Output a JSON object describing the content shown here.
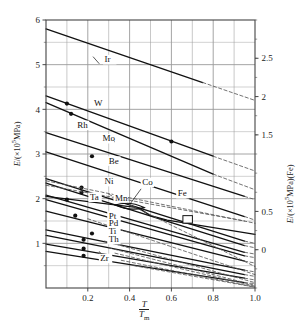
{
  "figure": {
    "xlabel_numerator": "T",
    "xlabel_denominator": "T",
    "xlabel_denominator_sub": "m",
    "ylabel_left": "E/(×10⁵MPa)",
    "ylabel_right": "E/(×10⁵MPa)(Fe)",
    "background": "#ffffff",
    "line_color": "#111111",
    "grid_color": "#9a9a9a"
  },
  "chart_data": {
    "type": "line",
    "title": "",
    "xlabel": "T/Tm",
    "ylabel": "E/(×10⁵MPa)",
    "ylabel_right": "E/(×10⁵MPa)(Fe)",
    "xlim": [
      0.0,
      1.0
    ],
    "ylim": [
      0.0,
      6.0
    ],
    "ylim_right": [
      -0.5,
      3.0
    ],
    "xticks": [
      0.2,
      0.4,
      0.6,
      0.8,
      1.0
    ],
    "xticklabels": [
      "0.2",
      "0.4",
      "0.6",
      "0.8",
      "1.0"
    ],
    "yticks": [
      1,
      2,
      3,
      4,
      5,
      6
    ],
    "yticklabels": [
      "1",
      "2",
      "3",
      "4",
      "5",
      "6"
    ],
    "yticks_right": [
      0,
      0.5,
      1.5,
      2,
      2.5
    ],
    "yticklabels_right": [
      "0",
      "0.5",
      "1.5",
      "2",
      "2.5"
    ],
    "grid": true,
    "grid_minor_x": 0.1,
    "legend": "inline-labels",
    "series": [
      {
        "name": "Ir",
        "label": "Ir",
        "solid": [
          [
            0.0,
            5.8
          ],
          [
            0.75,
            4.6
          ]
        ],
        "dashed": [
          [
            0.75,
            4.6
          ],
          [
            1.0,
            4.2
          ]
        ],
        "markers": []
      },
      {
        "name": "W",
        "label": "W",
        "solid": [
          [
            0.0,
            4.3
          ],
          [
            0.8,
            2.95
          ]
        ],
        "dashed": [
          [
            0.8,
            2.95
          ],
          [
            1.0,
            2.62
          ]
        ],
        "markers": [
          [
            0.1,
            4.13
          ],
          [
            0.6,
            3.28
          ]
        ]
      },
      {
        "name": "Rh",
        "label": "Rh",
        "solid": [
          [
            0.0,
            4.15
          ],
          [
            0.8,
            2.55
          ]
        ],
        "dashed": [
          [
            0.8,
            2.55
          ],
          [
            1.0,
            2.2
          ]
        ],
        "markers": [
          [
            0.12,
            3.9
          ]
        ]
      },
      {
        "name": "Mo",
        "label": "Mo",
        "solid": [
          [
            0.0,
            3.48
          ],
          [
            0.95,
            2.05
          ]
        ],
        "dashed": [
          [
            0.95,
            2.05
          ],
          [
            1.0,
            1.98
          ]
        ],
        "markers": []
      },
      {
        "name": "Be",
        "label": "Be",
        "solid": [
          [
            0.0,
            3.05
          ],
          [
            0.95,
            1.6
          ]
        ],
        "dashed": [
          [
            0.95,
            1.6
          ],
          [
            1.0,
            1.52
          ]
        ],
        "markers": [
          [
            0.22,
            2.95
          ]
        ]
      },
      {
        "name": "Ni",
        "label": "Ni",
        "solid": [
          [
            0.0,
            2.45
          ],
          [
            0.95,
            1.05
          ]
        ],
        "dashed": [
          [
            0.95,
            1.05
          ],
          [
            1.0,
            1.0
          ]
        ],
        "markers": [
          [
            0.17,
            2.25
          ]
        ]
      },
      {
        "name": "Co",
        "label": "Co",
        "solid": [
          [
            0.0,
            2.35
          ],
          [
            0.95,
            0.95
          ]
        ],
        "dashed": [
          [
            0.95,
            0.95
          ],
          [
            1.0,
            0.9
          ]
        ],
        "markers": [
          [
            0.17,
            2.14
          ]
        ]
      },
      {
        "name": "Fe",
        "label": "Fe",
        "solid": [
          [
            0.0,
            2.05
          ],
          [
            0.3,
            1.88
          ],
          [
            0.44,
            1.8
          ],
          [
            0.5,
            1.62
          ],
          [
            0.58,
            1.52
          ],
          [
            1.0,
            1.2
          ]
        ],
        "dashed": [],
        "markers": []
      },
      {
        "name": "Ta",
        "label": "Ta",
        "solid": [
          [
            0.0,
            2.08
          ],
          [
            0.95,
            0.8
          ]
        ],
        "dashed": [
          [
            0.95,
            0.8
          ],
          [
            1.0,
            0.76
          ]
        ],
        "markers": [
          [
            0.1,
            1.98
          ]
        ]
      },
      {
        "name": "Mn",
        "label": "Mn",
        "solid": [
          [
            0.0,
            1.98
          ],
          [
            0.95,
            0.72
          ]
        ],
        "dashed": [
          [
            0.95,
            0.72
          ],
          [
            1.0,
            0.68
          ]
        ],
        "markers": []
      },
      {
        "name": "Pt",
        "label": "Pt",
        "solid": [
          [
            0.0,
            1.72
          ],
          [
            0.95,
            0.6
          ]
        ],
        "dashed": [
          [
            0.95,
            0.6
          ],
          [
            1.0,
            0.56
          ]
        ],
        "markers": [
          [
            0.14,
            1.62
          ]
        ]
      },
      {
        "name": "Pd",
        "label": "Pd",
        "solid": [
          [
            0.0,
            1.3
          ],
          [
            0.95,
            0.4
          ]
        ],
        "dashed": [
          [
            0.95,
            0.4
          ],
          [
            1.0,
            0.36
          ]
        ],
        "markers": [
          [
            0.22,
            1.22
          ]
        ]
      },
      {
        "name": "Ti",
        "label": "Ti",
        "solid": [
          [
            0.0,
            1.18
          ],
          [
            0.95,
            0.3
          ]
        ],
        "dashed": [
          [
            0.95,
            0.3
          ],
          [
            1.0,
            0.26
          ]
        ],
        "markers": [
          [
            0.18,
            1.08
          ]
        ]
      },
      {
        "name": "Th",
        "label": "Th",
        "solid": [
          [
            0.0,
            0.98
          ],
          [
            0.95,
            0.22
          ]
        ],
        "dashed": [
          [
            0.95,
            0.22
          ],
          [
            1.0,
            0.18
          ]
        ],
        "markers": [
          [
            0.18,
            0.88
          ]
        ]
      },
      {
        "name": "Zr",
        "label": "Zr",
        "solid": [
          [
            0.0,
            0.82
          ],
          [
            0.95,
            0.12
          ]
        ],
        "dashed": [
          [
            0.95,
            0.12
          ],
          [
            1.0,
            0.1
          ]
        ],
        "markers": [
          [
            0.18,
            0.72
          ]
        ]
      }
    ],
    "dashed_extensions": [
      {
        "name": "Ni-ext",
        "points": [
          [
            0.0,
            2.4
          ],
          [
            1.0,
            1.45
          ]
        ]
      },
      {
        "name": "Ta-ext",
        "points": [
          [
            0.0,
            2.3
          ],
          [
            0.95,
            1.5
          ]
        ]
      },
      {
        "name": "low-ext-1",
        "points": [
          [
            0.3,
            2.1
          ],
          [
            1.0,
            0.48
          ]
        ]
      },
      {
        "name": "low-ext-2",
        "points": [
          [
            0.2,
            1.55
          ],
          [
            1.0,
            0.3
          ]
        ]
      },
      {
        "name": "low-ext-3",
        "points": [
          [
            0.28,
            1.05
          ],
          [
            1.0,
            0.12
          ]
        ]
      },
      {
        "name": "low-ext-4",
        "points": [
          [
            0.3,
            0.9
          ],
          [
            1.0,
            0.06
          ]
        ]
      },
      {
        "name": "low-ext-5",
        "points": [
          [
            0.33,
            0.78
          ],
          [
            1.0,
            0.04
          ]
        ]
      },
      {
        "name": "low-ext-6",
        "points": [
          [
            0.36,
            0.62
          ],
          [
            1.0,
            0.02
          ]
        ]
      },
      {
        "name": "low-ext-7",
        "points": [
          [
            0.42,
            0.5
          ],
          [
            1.0,
            0.02
          ]
        ]
      }
    ],
    "series_labels": [
      {
        "label": "Ir",
        "x": 0.28,
        "y": 5.05
      },
      {
        "label": "W",
        "x": 0.23,
        "y": 4.08
      },
      {
        "label": "Rh",
        "x": 0.15,
        "y": 3.58
      },
      {
        "label": "Mo",
        "x": 0.27,
        "y": 3.28
      },
      {
        "label": "Be",
        "x": 0.3,
        "y": 2.78
      },
      {
        "label": "Ni",
        "x": 0.28,
        "y": 2.32
      },
      {
        "label": "Co",
        "x": 0.46,
        "y": 2.3
      },
      {
        "label": "Fe",
        "x": 0.63,
        "y": 2.05
      },
      {
        "label": "Ta",
        "x": 0.21,
        "y": 1.97
      },
      {
        "label": "Mn",
        "x": 0.33,
        "y": 1.95
      },
      {
        "label": "Pt",
        "x": 0.3,
        "y": 1.55
      },
      {
        "label": "Pd",
        "x": 0.3,
        "y": 1.38
      },
      {
        "label": "Ti",
        "x": 0.3,
        "y": 1.2
      },
      {
        "label": "Th",
        "x": 0.3,
        "y": 1.02
      },
      {
        "label": "Zr",
        "x": 0.26,
        "y": 0.6
      }
    ],
    "annotations": [
      {
        "name": "co-loop",
        "type": "lens",
        "note": "small lens-shaped loop where Co and Mn curves cross"
      },
      {
        "name": "fe-step-box",
        "type": "box",
        "note": "small open rectangle marking the Fe curve step"
      }
    ]
  }
}
